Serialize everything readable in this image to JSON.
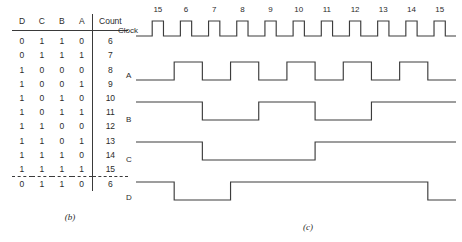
{
  "figure_b": {
    "caption": "(b)",
    "headers": [
      "D",
      "C",
      "B",
      "A",
      "Count"
    ],
    "rows": [
      {
        "D": "0",
        "C": "1",
        "B": "1",
        "A": "0",
        "count": "6"
      },
      {
        "D": "0",
        "C": "1",
        "B": "1",
        "A": "1",
        "count": "7"
      },
      {
        "D": "1",
        "C": "0",
        "B": "0",
        "A": "0",
        "count": "8"
      },
      {
        "D": "1",
        "C": "0",
        "B": "0",
        "A": "1",
        "count": "9"
      },
      {
        "D": "1",
        "C": "0",
        "B": "1",
        "A": "0",
        "count": "10"
      },
      {
        "D": "1",
        "C": "0",
        "B": "1",
        "A": "1",
        "count": "11"
      },
      {
        "D": "1",
        "C": "1",
        "B": "0",
        "A": "0",
        "count": "12"
      },
      {
        "D": "1",
        "C": "1",
        "B": "0",
        "A": "1",
        "count": "13"
      },
      {
        "D": "1",
        "C": "1",
        "B": "1",
        "A": "0",
        "count": "14"
      },
      {
        "D": "1",
        "C": "1",
        "B": "1",
        "A": "1",
        "count": "15"
      }
    ],
    "rollover_row": {
      "D": "0",
      "C": "1",
      "B": "1",
      "A": "0",
      "count": "6"
    }
  },
  "figure_c": {
    "caption": "(c)",
    "clock_label": "Clock",
    "signal_labels": [
      "A",
      "B",
      "C",
      "D"
    ],
    "tick_labels": [
      "15",
      "6",
      "7",
      "8",
      "9",
      "10",
      "11",
      "12",
      "13",
      "14",
      "15"
    ],
    "line_color": "#3c3c3c"
  },
  "chart_data": {
    "type": "line",
    "xlabel": "Clock count",
    "ylabel": "Logic level",
    "categories": [
      "15",
      "6",
      "7",
      "8",
      "9",
      "10",
      "11",
      "12",
      "13",
      "14",
      "15"
    ],
    "grid": false,
    "legend": "none",
    "series": [
      {
        "name": "Clock",
        "values": [
          1,
          1,
          1,
          1,
          1,
          1,
          1,
          1,
          1,
          1,
          1
        ]
      },
      {
        "name": "A",
        "values": [
          0,
          1,
          0,
          1,
          0,
          1,
          0,
          1,
          0,
          1,
          0
        ]
      },
      {
        "name": "B",
        "values": [
          1,
          1,
          0,
          0,
          1,
          1,
          0,
          0,
          1,
          1,
          1
        ]
      },
      {
        "name": "C",
        "values": [
          1,
          1,
          0,
          0,
          0,
          0,
          1,
          1,
          1,
          1,
          1
        ]
      },
      {
        "name": "D",
        "values": [
          1,
          0,
          0,
          1,
          1,
          1,
          1,
          1,
          1,
          1,
          0
        ]
      }
    ]
  }
}
